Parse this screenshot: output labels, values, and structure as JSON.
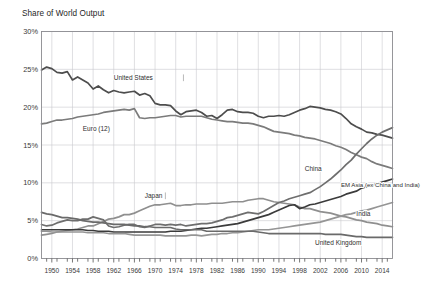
{
  "chart_data": {
    "type": "line",
    "title": "Share of World Output",
    "xlabel": "",
    "ylabel": "",
    "grid": true,
    "legend_position": "inline-annotations",
    "ylim": [
      0,
      30
    ],
    "yticks": [
      "0%",
      "5%",
      "10%",
      "15%",
      "20%",
      "25%",
      "30%"
    ],
    "ytick_values": [
      0,
      5,
      10,
      15,
      20,
      25,
      30
    ],
    "xlim": [
      1948,
      2016
    ],
    "xticks": [
      "1950",
      "1954",
      "1958",
      "1962",
      "1966",
      "1970",
      "1974",
      "1978",
      "1982",
      "1986",
      "1990",
      "1994",
      "1998",
      "2002",
      "2006",
      "2010",
      "2014"
    ],
    "xtick_values": [
      1950,
      1954,
      1958,
      1962,
      1966,
      1970,
      1974,
      1978,
      1982,
      1986,
      1990,
      1994,
      1998,
      2002,
      2006,
      2010,
      2014
    ],
    "x": [
      1948,
      1949,
      1950,
      1951,
      1952,
      1953,
      1954,
      1955,
      1956,
      1957,
      1958,
      1959,
      1960,
      1961,
      1962,
      1963,
      1964,
      1965,
      1966,
      1967,
      1968,
      1969,
      1970,
      1971,
      1972,
      1973,
      1974,
      1975,
      1976,
      1977,
      1978,
      1979,
      1980,
      1981,
      1982,
      1983,
      1984,
      1985,
      1986,
      1987,
      1988,
      1989,
      1990,
      1991,
      1992,
      1993,
      1994,
      1995,
      1996,
      1997,
      1998,
      1999,
      2000,
      2001,
      2002,
      2003,
      2004,
      2005,
      2006,
      2007,
      2008,
      2009,
      2010,
      2011,
      2012,
      2013,
      2014,
      2015,
      2016
    ],
    "series": [
      {
        "name": "United States",
        "label": "United States",
        "color": "#4d4d4d",
        "values": [
          24.9,
          25.3,
          25.1,
          24.6,
          24.5,
          24.7,
          23.6,
          24.0,
          23.6,
          23.2,
          22.4,
          22.8,
          22.3,
          21.9,
          22.2,
          22.0,
          21.9,
          22.0,
          22.1,
          21.6,
          21.8,
          21.5,
          20.5,
          20.3,
          20.3,
          20.2,
          19.5,
          19.0,
          19.4,
          19.5,
          19.6,
          19.3,
          18.8,
          18.9,
          18.5,
          19.0,
          19.6,
          19.7,
          19.4,
          19.3,
          19.3,
          19.2,
          18.8,
          18.6,
          18.8,
          18.8,
          18.9,
          18.8,
          19.0,
          19.3,
          19.6,
          19.8,
          20.1,
          20.0,
          19.9,
          19.7,
          19.6,
          19.4,
          19.1,
          18.5,
          17.8,
          17.4,
          17.1,
          16.7,
          16.6,
          16.4,
          16.3,
          16.1,
          15.9
        ]
      },
      {
        "name": "Euro (12)",
        "label": "Euro (12)",
        "color": "#7b7b7b",
        "values": [
          17.8,
          17.9,
          18.1,
          18.3,
          18.3,
          18.4,
          18.5,
          18.7,
          18.8,
          18.9,
          19.0,
          19.1,
          19.3,
          19.4,
          19.5,
          19.6,
          19.7,
          19.6,
          19.8,
          18.6,
          18.5,
          18.6,
          18.6,
          18.7,
          18.8,
          18.9,
          18.9,
          18.7,
          18.8,
          18.8,
          18.8,
          18.8,
          18.6,
          18.4,
          18.3,
          18.2,
          18.1,
          18.1,
          18.0,
          17.9,
          17.9,
          17.8,
          17.6,
          17.4,
          17.1,
          16.8,
          16.7,
          16.6,
          16.5,
          16.3,
          16.2,
          16.0,
          15.9,
          15.8,
          15.6,
          15.4,
          15.2,
          14.9,
          14.7,
          14.4,
          14.0,
          13.7,
          13.4,
          13.2,
          12.8,
          12.5,
          12.3,
          12.1,
          11.9
        ]
      },
      {
        "name": "Japan",
        "label": "Japan",
        "color": "#8f8f8f",
        "values": [
          3.1,
          3.2,
          3.3,
          3.5,
          3.6,
          3.7,
          3.8,
          3.9,
          4.1,
          4.3,
          4.3,
          4.6,
          4.9,
          5.2,
          5.3,
          5.5,
          5.8,
          5.8,
          6.0,
          6.3,
          6.6,
          6.9,
          7.1,
          7.1,
          7.2,
          7.3,
          7.0,
          7.0,
          7.1,
          7.1,
          7.2,
          7.2,
          7.2,
          7.3,
          7.3,
          7.3,
          7.4,
          7.5,
          7.5,
          7.5,
          7.7,
          7.8,
          7.9,
          7.9,
          7.7,
          7.5,
          7.4,
          7.3,
          7.2,
          7.1,
          6.8,
          6.6,
          6.6,
          6.4,
          6.2,
          6.1,
          6.0,
          5.8,
          5.6,
          5.5,
          5.3,
          5.1,
          5.0,
          4.8,
          4.7,
          4.6,
          4.4,
          4.3,
          4.2
        ]
      },
      {
        "name": "China",
        "label": "China",
        "color": "#6e6e6e",
        "values": [
          4.5,
          4.3,
          4.4,
          4.7,
          4.9,
          5.1,
          5.0,
          5.0,
          5.2,
          5.2,
          5.5,
          5.3,
          5.1,
          4.3,
          4.1,
          4.2,
          4.4,
          4.5,
          4.5,
          4.2,
          4.1,
          4.3,
          4.5,
          4.5,
          4.4,
          4.5,
          4.4,
          4.5,
          4.3,
          4.4,
          4.5,
          4.6,
          4.6,
          4.7,
          4.9,
          5.1,
          5.4,
          5.5,
          5.7,
          5.9,
          6.1,
          6.0,
          5.9,
          6.2,
          6.6,
          7.0,
          7.4,
          7.6,
          7.9,
          8.1,
          8.3,
          8.5,
          8.7,
          9.1,
          9.5,
          10.0,
          10.5,
          11.1,
          11.7,
          12.4,
          13.0,
          13.8,
          14.5,
          15.2,
          15.8,
          16.3,
          16.7,
          17.0,
          17.3
        ]
      },
      {
        "name": "EM Asia (ex China and India)",
        "label": "EM Asia (ex China and India)",
        "color": "#3b3b3b",
        "values": [
          3.8,
          3.8,
          3.8,
          3.8,
          3.8,
          3.8,
          3.8,
          3.8,
          3.8,
          3.7,
          3.7,
          3.6,
          3.6,
          3.6,
          3.5,
          3.5,
          3.5,
          3.5,
          3.5,
          3.5,
          3.5,
          3.5,
          3.5,
          3.5,
          3.5,
          3.6,
          3.6,
          3.6,
          3.7,
          3.8,
          3.9,
          4.0,
          4.0,
          4.1,
          4.2,
          4.3,
          4.4,
          4.5,
          4.6,
          4.8,
          5.0,
          5.2,
          5.4,
          5.6,
          5.8,
          6.1,
          6.4,
          6.7,
          7.0,
          7.1,
          6.6,
          6.8,
          7.1,
          7.2,
          7.4,
          7.6,
          7.8,
          8.0,
          8.2,
          8.5,
          8.7,
          8.9,
          9.3,
          9.5,
          9.7,
          9.9,
          10.1,
          10.3,
          10.5
        ]
      },
      {
        "name": "India",
        "label": "India",
        "color": "#959595",
        "values": [
          3.6,
          3.6,
          3.5,
          3.5,
          3.5,
          3.5,
          3.5,
          3.5,
          3.5,
          3.4,
          3.4,
          3.4,
          3.4,
          3.3,
          3.3,
          3.3,
          3.3,
          3.2,
          3.1,
          3.1,
          3.1,
          3.1,
          3.1,
          3.1,
          3.0,
          3.0,
          3.0,
          3.0,
          3.0,
          3.1,
          3.1,
          3.0,
          3.1,
          3.2,
          3.2,
          3.3,
          3.3,
          3.4,
          3.4,
          3.5,
          3.6,
          3.7,
          3.8,
          3.8,
          3.8,
          3.9,
          4.0,
          4.1,
          4.2,
          4.3,
          4.4,
          4.5,
          4.6,
          4.7,
          4.8,
          5.0,
          5.2,
          5.4,
          5.6,
          5.8,
          5.9,
          6.1,
          6.3,
          6.4,
          6.6,
          6.8,
          7.0,
          7.2,
          7.4
        ]
      },
      {
        "name": "United Kingdom",
        "label": "United Kingdom",
        "color": "#6a6a6a",
        "values": [
          6.1,
          5.9,
          5.8,
          5.6,
          5.4,
          5.4,
          5.3,
          5.2,
          5.0,
          4.9,
          4.8,
          4.8,
          4.7,
          4.6,
          4.5,
          4.5,
          4.5,
          4.4,
          4.3,
          4.3,
          4.2,
          4.2,
          4.1,
          4.1,
          4.1,
          4.1,
          3.9,
          3.8,
          3.8,
          3.8,
          3.8,
          3.8,
          3.6,
          3.6,
          3.6,
          3.6,
          3.6,
          3.6,
          3.6,
          3.6,
          3.6,
          3.6,
          3.5,
          3.4,
          3.3,
          3.3,
          3.3,
          3.3,
          3.3,
          3.3,
          3.3,
          3.3,
          3.3,
          3.3,
          3.3,
          3.2,
          3.2,
          3.2,
          3.2,
          3.1,
          3.0,
          2.9,
          2.9,
          2.8,
          2.8,
          2.8,
          2.8,
          2.8,
          2.8
        ]
      }
    ],
    "annotations": [
      {
        "text": "United States",
        "x": 1962,
        "y": 23.6
      },
      {
        "text": "Euro (12)",
        "x": 1956,
        "y": 16.8
      },
      {
        "text": "Japan",
        "x": 1968,
        "y": 8.0
      },
      {
        "text": "China",
        "x": 1999,
        "y": 11.6
      },
      {
        "text": "EM Asia (ex China and India)",
        "x": 2006,
        "y": 9.4
      },
      {
        "text": "India",
        "x": 2009,
        "y": 5.6
      },
      {
        "text": "United Kingdom",
        "x": 2001,
        "y": 1.8
      }
    ]
  }
}
